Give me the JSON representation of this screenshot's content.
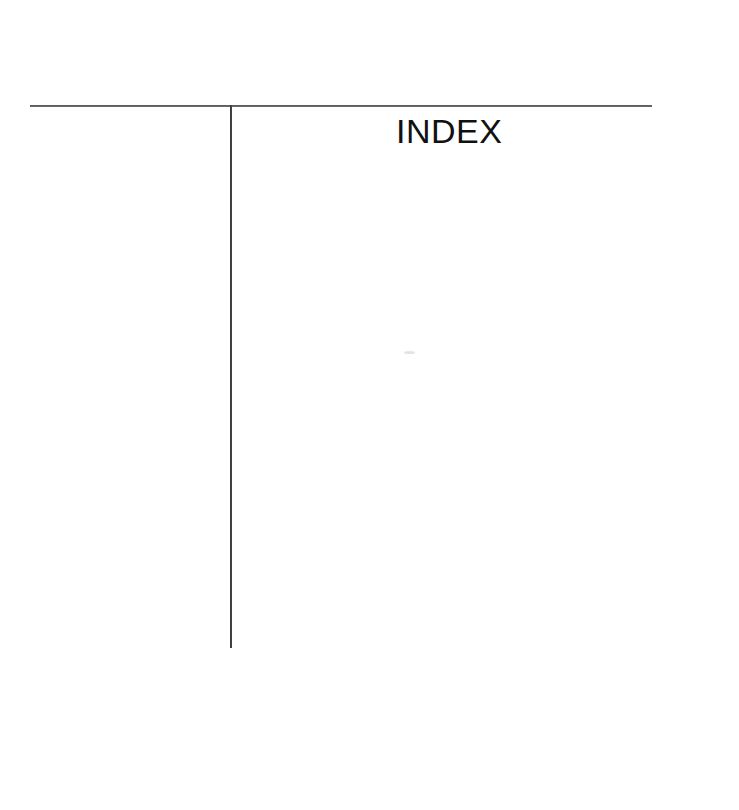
{
  "page": {
    "type": "scanned-book-page",
    "background_color": "#ffffff",
    "width": 739,
    "height": 810,
    "heading": "INDEX",
    "body_text": "",
    "margin_column_text": ""
  },
  "rules": {
    "horizontal": {
      "name": "horizontal-rule",
      "color": "#4a4a4a",
      "x": 30,
      "y": 105,
      "length": 622,
      "thickness": 2
    },
    "vertical": {
      "name": "vertical-rule",
      "color": "#1f1f1f",
      "x": 230,
      "y": 105,
      "length": 543,
      "thickness": 2
    }
  },
  "artifacts": {
    "speck_label": ""
  }
}
